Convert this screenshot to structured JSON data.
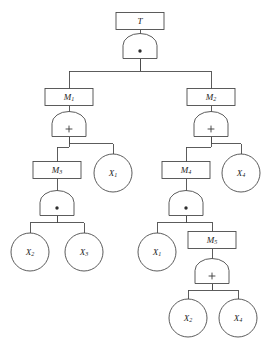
{
  "diagram": {
    "type": "fault-tree",
    "background_color": "#ffffff",
    "line_color": "#4a4a4a",
    "text_color": "#1c1c1c",
    "gate_symbols": {
      "and": "·",
      "or": "+"
    },
    "nodes": [
      {
        "id": "T",
        "kind": "rect",
        "base": "T",
        "sub": "",
        "x": 140,
        "y": 21
      },
      {
        "id": "G1",
        "kind": "gate",
        "base": "",
        "sub": "",
        "gate": "and",
        "x": 140,
        "y": 52
      },
      {
        "id": "M1",
        "kind": "rect",
        "base": "M",
        "sub": "1",
        "x": 69,
        "y": 97
      },
      {
        "id": "M2",
        "kind": "rect",
        "base": "M",
        "sub": "2",
        "x": 211,
        "y": 97
      },
      {
        "id": "G2",
        "kind": "gate",
        "base": "",
        "sub": "",
        "gate": "or",
        "x": 69,
        "y": 130
      },
      {
        "id": "G3",
        "kind": "gate",
        "base": "",
        "sub": "",
        "gate": "or",
        "x": 211,
        "y": 130
      },
      {
        "id": "M3",
        "kind": "rect",
        "base": "M",
        "sub": "3",
        "x": 57,
        "y": 170
      },
      {
        "id": "X1a",
        "kind": "circle",
        "base": "X",
        "sub": "1",
        "x": 113,
        "y": 173
      },
      {
        "id": "M4",
        "kind": "rect",
        "base": "M",
        "sub": "4",
        "x": 186,
        "y": 170
      },
      {
        "id": "X4a",
        "kind": "circle",
        "base": "X",
        "sub": "4",
        "x": 241,
        "y": 173
      },
      {
        "id": "G4",
        "kind": "gate",
        "base": "",
        "sub": "",
        "gate": "and",
        "x": 57,
        "y": 209
      },
      {
        "id": "G5",
        "kind": "gate",
        "base": "",
        "sub": "",
        "gate": "and",
        "x": 186,
        "y": 209
      },
      {
        "id": "X2a",
        "kind": "circle",
        "base": "X",
        "sub": "2",
        "x": 30,
        "y": 252
      },
      {
        "id": "X3",
        "kind": "circle",
        "base": "X",
        "sub": "3",
        "x": 84,
        "y": 252
      },
      {
        "id": "X1b",
        "kind": "circle",
        "base": "X",
        "sub": "1",
        "x": 157,
        "y": 252
      },
      {
        "id": "M5",
        "kind": "rect",
        "base": "M",
        "sub": "5",
        "x": 212,
        "y": 240
      },
      {
        "id": "G6",
        "kind": "gate",
        "base": "",
        "sub": "",
        "gate": "or",
        "x": 212,
        "y": 277
      },
      {
        "id": "X2b",
        "kind": "circle",
        "base": "X",
        "sub": "2",
        "x": 188,
        "y": 318
      },
      {
        "id": "X4b",
        "kind": "circle",
        "base": "X",
        "sub": "4",
        "x": 238,
        "y": 318
      }
    ],
    "edges": [
      {
        "from": "T",
        "to": "G1",
        "style": "straight"
      },
      {
        "from": "G1",
        "to": "M1",
        "style": "elbow"
      },
      {
        "from": "G1",
        "to": "M2",
        "style": "elbow"
      },
      {
        "from": "M1",
        "to": "G2",
        "style": "straight"
      },
      {
        "from": "M2",
        "to": "G3",
        "style": "straight"
      },
      {
        "from": "G2",
        "to": "M3",
        "style": "elbow"
      },
      {
        "from": "G2",
        "to": "X1a",
        "style": "elbow"
      },
      {
        "from": "G3",
        "to": "M4",
        "style": "elbow"
      },
      {
        "from": "G3",
        "to": "X4a",
        "style": "elbow"
      },
      {
        "from": "M3",
        "to": "G4",
        "style": "straight"
      },
      {
        "from": "M4",
        "to": "G5",
        "style": "straight"
      },
      {
        "from": "G4",
        "to": "X2a",
        "style": "elbow"
      },
      {
        "from": "G4",
        "to": "X3",
        "style": "elbow"
      },
      {
        "from": "G5",
        "to": "X1b",
        "style": "elbow"
      },
      {
        "from": "G5",
        "to": "M5",
        "style": "elbow"
      },
      {
        "from": "M5",
        "to": "G6",
        "style": "straight"
      },
      {
        "from": "G6",
        "to": "X2b",
        "style": "elbow"
      },
      {
        "from": "G6",
        "to": "X4b",
        "style": "elbow"
      }
    ]
  }
}
